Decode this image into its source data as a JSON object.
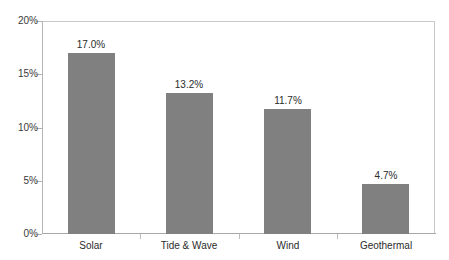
{
  "chart_data": {
    "type": "bar",
    "title": "",
    "subtitle": "",
    "xlabel": "",
    "ylabel": "",
    "categories": [
      "Solar",
      "Tide & Wave",
      "Wind",
      "Geothermal"
    ],
    "values": [
      17.0,
      13.2,
      11.7,
      4.7
    ],
    "value_labels": [
      "17.0%",
      "13.2%",
      "11.7%",
      "4.7%"
    ],
    "ylim": [
      0,
      20
    ],
    "ytick_values": [
      0,
      5,
      10,
      15,
      20
    ],
    "ytick_labels": [
      "0%",
      "5%",
      "10%",
      "15%",
      "20%"
    ],
    "grid": false,
    "legend": false,
    "legend_position": "none",
    "bar_color": "#808080",
    "frame_color": "#c9c9c9",
    "axis_color": "#a8a8a8",
    "text_color": "#2b2b2b",
    "background": "#ffffff"
  }
}
